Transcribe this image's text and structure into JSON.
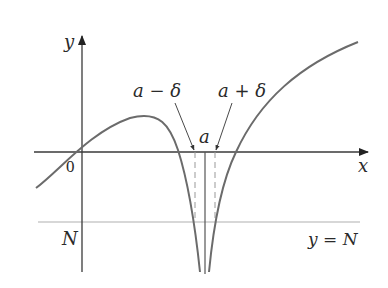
{
  "figure": {
    "type": "limit-definition-infinite-diagram",
    "axes": {
      "x_label": "x",
      "y_label": "y",
      "origin_label": "0"
    },
    "labels": {
      "a_minus_delta": "a − δ",
      "a_plus_delta": "a + δ",
      "a": "a",
      "N": "N",
      "y_equals_N": "y = N"
    },
    "colors": {
      "curve": "#6b6b6b",
      "axis": "#3a3a3a",
      "dashed": "#9a9a9a",
      "text": "#2a2a2a"
    }
  }
}
